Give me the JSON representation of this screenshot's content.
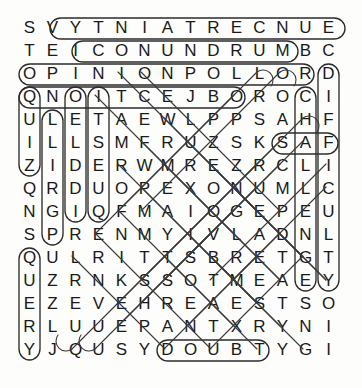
{
  "puzzle": {
    "type": "word-search",
    "title": "Word Search Puzzle",
    "rows": 15,
    "cols": 14,
    "cell_size": 23,
    "origin_x": 18,
    "origin_y": 16,
    "letter_color": "#1a1a1a",
    "mark_color": "#2b2b2b",
    "background": "#fdfdfc",
    "grid": [
      [
        "S",
        "V",
        "Y",
        "T",
        "N",
        "I",
        "A",
        "T",
        "R",
        "E",
        "C",
        "N",
        "U",
        "E"
      ],
      [
        "T",
        "E",
        "I",
        "C",
        "O",
        "N",
        "U",
        "N",
        "D",
        "R",
        "U",
        "M",
        "B",
        "C"
      ],
      [
        "O",
        "P",
        "I",
        "N",
        "I",
        "O",
        "N",
        "P",
        "O",
        "L",
        "L",
        "O",
        "R",
        "D"
      ],
      [
        "Q",
        "N",
        "O",
        "I",
        "T",
        "C",
        "E",
        "J",
        "B",
        "O",
        "R",
        "O",
        "C",
        "I"
      ],
      [
        "U",
        "L",
        "E",
        "T",
        "A",
        "E",
        "W",
        "L",
        "P",
        "P",
        "S",
        "A",
        "H",
        "F"
      ],
      [
        "I",
        "L",
        "L",
        "S",
        "M",
        "F",
        "R",
        "U",
        "Z",
        "S",
        "K",
        "S",
        "A",
        "F"
      ],
      [
        "Z",
        "I",
        "D",
        "E",
        "R",
        "W",
        "M",
        "R",
        "E",
        "Z",
        "R",
        "C",
        "L",
        "I"
      ],
      [
        "Q",
        "R",
        "D",
        "U",
        "O",
        "P",
        "E",
        "X",
        "O",
        "N",
        "U",
        "M",
        "L",
        "C"
      ],
      [
        "N",
        "G",
        "I",
        "Q",
        "F",
        "M",
        "A",
        "I",
        "O",
        "G",
        "E",
        "P",
        "E",
        "U"
      ],
      [
        "S",
        "P",
        "R",
        "E",
        "N",
        "M",
        "Y",
        "I",
        "V",
        "L",
        "A",
        "D",
        "N",
        "L"
      ],
      [
        "Q",
        "U",
        "L",
        "R",
        "I",
        "T",
        "T",
        "S",
        "B",
        "R",
        "E",
        "T",
        "G",
        "T"
      ],
      [
        "U",
        "Z",
        "R",
        "N",
        "K",
        "S",
        "S",
        "O",
        "T",
        "M",
        "E",
        "A",
        "E",
        "Y"
      ],
      [
        "E",
        "Z",
        "E",
        "V",
        "E",
        "H",
        "R",
        "E",
        "A",
        "E",
        "S",
        "T",
        "S",
        "O"
      ],
      [
        "R",
        "L",
        "U",
        "U",
        "E",
        "P",
        "A",
        "N",
        "T",
        "X",
        "R",
        "Y",
        "N",
        "I"
      ],
      [
        "Y",
        "J",
        "Q",
        "U",
        "S",
        "Y",
        "D",
        "O",
        "U",
        "B",
        "T",
        "Y",
        "G",
        "I"
      ]
    ],
    "found_words": [
      {
        "word": "UNCERTAINTY",
        "start": [
          0,
          13
        ],
        "end": [
          0,
          2
        ],
        "direction": "horizontal-reverse"
      },
      {
        "word": "CONUNDRUM",
        "start": [
          1,
          3
        ],
        "end": [
          1,
          11
        ],
        "direction": "horizontal"
      },
      {
        "word": "OPINION POLL",
        "start": [
          2,
          0
        ],
        "end": [
          2,
          11
        ],
        "direction": "horizontal"
      },
      {
        "word": "OBJECTION",
        "start": [
          3,
          8
        ],
        "end": [
          3,
          0
        ],
        "direction": "horizontal-reverse"
      },
      {
        "word": "DOUBT",
        "start": [
          14,
          6
        ],
        "end": [
          14,
          10
        ],
        "direction": "horizontal"
      },
      {
        "word": "QUIZ",
        "start": [
          3,
          0
        ],
        "end": [
          6,
          0
        ],
        "direction": "vertical"
      },
      {
        "word": "QUERY",
        "start": [
          10,
          0
        ],
        "end": [
          14,
          0
        ],
        "direction": "vertical"
      },
      {
        "word": "CHALLENGE",
        "start": [
          3,
          12
        ],
        "end": [
          11,
          12
        ],
        "direction": "vertical"
      },
      {
        "word": "DIFFICULTY",
        "start": [
          2,
          13
        ],
        "end": [
          11,
          13
        ],
        "direction": "vertical"
      },
      {
        "word": "RIDDLE",
        "start": [
          8,
          2
        ],
        "end": [
          3,
          2
        ],
        "direction": "vertical-reverse"
      },
      {
        "word": "QUESTION",
        "start": [
          3,
          3
        ],
        "end": [
          8,
          3
        ],
        "direction": "vertical"
      },
      {
        "word": "ASK",
        "start": [
          5,
          10
        ],
        "end": [
          5,
          12
        ],
        "direction": "horizontal"
      },
      {
        "word": "PERPLEX",
        "start": [
          4,
          9
        ],
        "end": [
          7,
          7
        ],
        "direction": "diagonal"
      },
      {
        "word": "MYSTERY",
        "start": [
          9,
          5
        ],
        "end": [
          13,
          11
        ],
        "direction": "diagonal"
      },
      {
        "word": "ENIGMA",
        "start": [
          9,
          10
        ],
        "end": [
          8,
          5
        ],
        "direction": "diagonal"
      },
      {
        "word": "WONDER",
        "start": [
          6,
          5
        ],
        "end": [
          11,
          9
        ],
        "direction": "diagonal"
      },
      {
        "word": "PROBLEM",
        "start": [
          7,
          5
        ],
        "end": [
          12,
          9
        ],
        "direction": "diagonal"
      }
    ]
  }
}
